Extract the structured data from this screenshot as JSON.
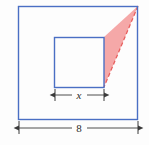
{
  "figure": {
    "colors": {
      "square_stroke": "#4a6fc4",
      "triangle_fill": "#f4a3a3",
      "triangle_stroke": "#e8605f",
      "dimension_line": "#3a3a3a",
      "background": "#fdfdfd"
    },
    "outer_square": {
      "name": "outer-square",
      "side_label": "8",
      "x": 18,
      "y": 6,
      "size": 120
    },
    "inner_square": {
      "name": "inner-square",
      "side_label": "x",
      "x": 54,
      "y": 37,
      "size": 50
    },
    "triangle": {
      "name": "shaded-triangle",
      "vertices": [
        {
          "x": 138,
          "y": 6
        },
        {
          "x": 104,
          "y": 37
        },
        {
          "x": 104,
          "y": 87
        }
      ],
      "hypotenuse_style": "dashed"
    },
    "dimensions": [
      {
        "name": "x-dimension",
        "label": "x",
        "italic": true,
        "x1": 55,
        "x2": 104,
        "y": 95,
        "label_x": 79,
        "label_y": 98
      },
      {
        "name": "width-dimension",
        "label": "8",
        "italic": false,
        "x1": 19,
        "x2": 138,
        "y": 128,
        "label_x": 79,
        "label_y": 131
      }
    ]
  }
}
